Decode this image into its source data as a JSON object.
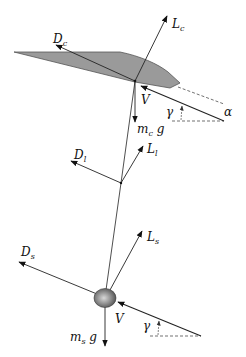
{
  "diagram": {
    "type": "free-body force diagram",
    "colors": {
      "canopy_fill": "#9a9a9a",
      "canopy_stroke": "#555555",
      "line": "#222222",
      "dashed": "#333333",
      "payload_light": "#d8d8d8",
      "payload_dark": "#4a4a4a"
    },
    "canopy": {
      "labels": {
        "lift": {
          "main": "L",
          "sub": "c"
        },
        "drag": {
          "main": "D",
          "sub": "c"
        },
        "velocity": "V",
        "weight": {
          "main": "m",
          "sub": "c",
          "tail": " g"
        },
        "flight_path_angle": "γ",
        "angle_of_attack": "α"
      }
    },
    "link": {
      "labels": {
        "lift": {
          "main": "L",
          "sub": "l"
        },
        "drag": {
          "main": "D",
          "sub": "l"
        }
      }
    },
    "payload": {
      "labels": {
        "lift": {
          "main": "L",
          "sub": "s"
        },
        "drag": {
          "main": "D",
          "sub": "s"
        },
        "velocity": "V",
        "weight": {
          "main": "m",
          "sub": "s",
          "tail": " g"
        },
        "flight_path_angle": "γ"
      }
    }
  }
}
